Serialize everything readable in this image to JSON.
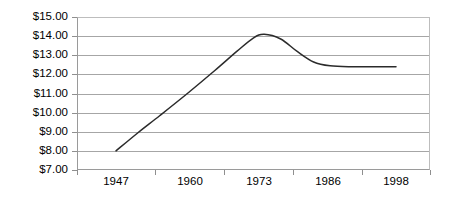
{
  "chart_data": {
    "type": "line",
    "title": "",
    "subtitle": "",
    "xlabel": "",
    "ylabel": "",
    "grid": true,
    "legend": false,
    "legend_position": "none",
    "line_color": "#2b2b2b",
    "gridline_color": "#a6a6a6",
    "axis_color": "#8f8f8f",
    "background_color": "#ffffff",
    "ylim": [
      7.0,
      15.0
    ],
    "ytick_labels": [
      "$15.00",
      "$14.00",
      "$13.00",
      "$12.00",
      "$11.00",
      "$10.00",
      "$9.00",
      "$8.00",
      "$7.00"
    ],
    "ytick_values": [
      15.0,
      14.0,
      13.0,
      12.0,
      11.0,
      10.0,
      9.0,
      8.0,
      7.0
    ],
    "xtick_labels": [
      "1947",
      "1960",
      "1973",
      "1986",
      "1998"
    ],
    "x": [
      1947,
      1960,
      1973,
      1986,
      1998
    ],
    "values": [
      8.0,
      11.0,
      14.05,
      12.45,
      12.4
    ],
    "series": [
      {
        "name": "value",
        "points": [
          {
            "x": 1947,
            "y": 8.0
          },
          {
            "x": 1951,
            "y": 8.95
          },
          {
            "x": 1955,
            "y": 9.85
          },
          {
            "x": 1960,
            "y": 11.0
          },
          {
            "x": 1965,
            "y": 12.2
          },
          {
            "x": 1969,
            "y": 13.2
          },
          {
            "x": 1972,
            "y": 13.9
          },
          {
            "x": 1974,
            "y": 14.1
          },
          {
            "x": 1977,
            "y": 13.85
          },
          {
            "x": 1980,
            "y": 13.2
          },
          {
            "x": 1983,
            "y": 12.65
          },
          {
            "x": 1986,
            "y": 12.45
          },
          {
            "x": 1990,
            "y": 12.4
          },
          {
            "x": 1994,
            "y": 12.4
          },
          {
            "x": 1998,
            "y": 12.4
          }
        ]
      }
    ]
  }
}
